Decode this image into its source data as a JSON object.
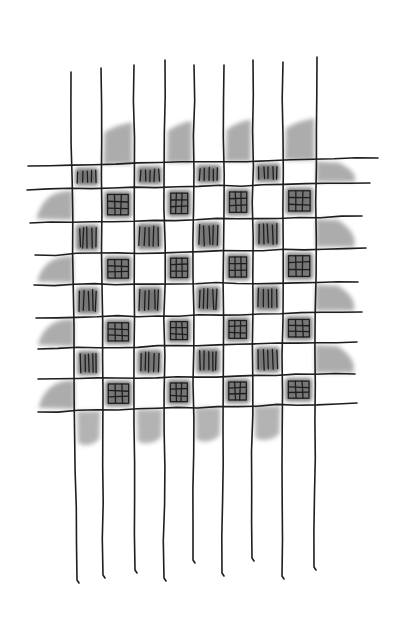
{
  "image": {
    "description": "Pencil sketch of a woven checkerboard grid with hatched dark cells and smudged shading around the edges",
    "width": 410,
    "height": 626,
    "background": "#ffffff",
    "ink_color": "#1e1e1e",
    "shade_color": "#6a6a6a",
    "cell_fill": "#4a4a4a"
  },
  "grid": {
    "columns": 8,
    "rows": 8,
    "vertical_lines": [
      {
        "top": [
          71,
          72
        ],
        "bottom": [
          77,
          580
        ]
      },
      {
        "top": [
          101,
          68
        ],
        "bottom": [
          103,
          575
        ]
      },
      {
        "top": [
          134,
          65
        ],
        "bottom": [
          135,
          570
        ]
      },
      {
        "top": [
          165,
          60
        ],
        "bottom": [
          164,
          578
        ]
      },
      {
        "top": [
          194,
          65
        ],
        "bottom": [
          193,
          560
        ]
      },
      {
        "top": [
          224,
          65
        ],
        "bottom": [
          222,
          573
        ]
      },
      {
        "top": [
          253,
          60
        ],
        "bottom": [
          252,
          558
        ]
      },
      {
        "top": [
          283,
          62
        ],
        "bottom": [
          282,
          576
        ]
      },
      {
        "top": [
          317,
          57
        ],
        "bottom": [
          314,
          567
        ]
      }
    ],
    "horizontal_lines": [
      {
        "left": [
          28,
          166
        ],
        "right": [
          378,
          158
        ]
      },
      {
        "left": [
          27,
          190
        ],
        "right": [
          370,
          183
        ]
      },
      {
        "left": [
          30,
          223
        ],
        "right": [
          362,
          216
        ]
      },
      {
        "left": [
          35,
          255
        ],
        "right": [
          366,
          248
        ]
      },
      {
        "left": [
          34,
          285
        ],
        "right": [
          358,
          282
        ]
      },
      {
        "left": [
          36,
          318
        ],
        "right": [
          362,
          312
        ]
      },
      {
        "left": [
          38,
          349
        ],
        "right": [
          357,
          342
        ]
      },
      {
        "left": [
          38,
          379
        ],
        "right": [
          355,
          374
        ]
      },
      {
        "left": [
          38,
          412
        ],
        "right": [
          357,
          403
        ]
      }
    ],
    "dark_cell_pattern": "checkerboard",
    "even_row_hatch": "vertical-strokes",
    "odd_row_hatch": "crosshatch-grid",
    "outer_shading": {
      "top_columns": [
        1,
        3,
        5,
        7
      ],
      "bottom_columns": [
        0,
        2,
        4,
        6
      ],
      "left_rows": [
        1,
        3,
        5,
        7
      ],
      "right_rows": [
        0,
        2,
        4,
        6
      ]
    }
  }
}
